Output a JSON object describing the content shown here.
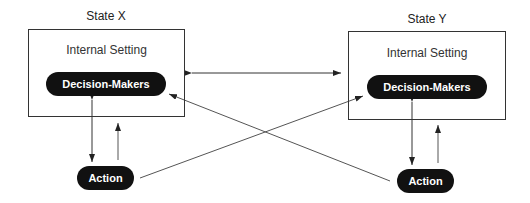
{
  "diagram": {
    "state_x": {
      "label": "State X",
      "internal_setting": "Internal Setting",
      "decision_makers": "Decision-Makers",
      "action": "Action"
    },
    "state_y": {
      "label": "State Y",
      "internal_setting": "Internal Setting",
      "decision_makers": "Decision-Makers",
      "action": "Action"
    },
    "colors": {
      "pill_fill": "#111111",
      "pill_text": "#ffffff",
      "line": "#333333"
    }
  }
}
